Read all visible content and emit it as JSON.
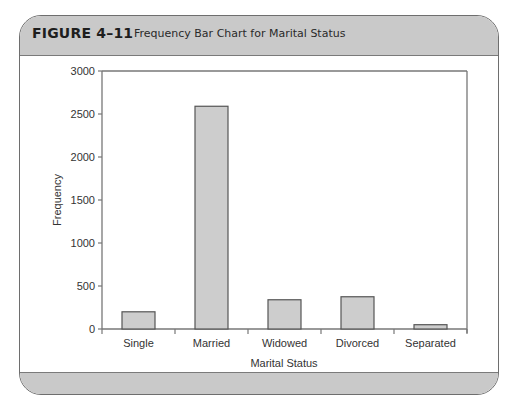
{
  "figure": {
    "number": "FIGURE 4–11",
    "title": "Frequency Bar Chart for Marital Status"
  },
  "colors": {
    "frame_band": "#c9c9c9",
    "frame_border": "#6e6e6e",
    "bar_fill": "#cdcdcd",
    "bar_stroke": "#555555",
    "axis": "#777777"
  },
  "chart_data": {
    "type": "bar",
    "title": "Frequency Bar Chart for Marital Status",
    "xlabel": "Marital Status",
    "ylabel": "Frequency",
    "categories": [
      "Single",
      "Married",
      "Widowed",
      "Divorced",
      "Separated"
    ],
    "values": [
      200,
      2590,
      340,
      375,
      50
    ],
    "ylim": [
      0,
      3000
    ],
    "yticks": [
      0,
      500,
      1000,
      1500,
      2000,
      2500,
      3000
    ],
    "grid": false,
    "legend": null
  }
}
